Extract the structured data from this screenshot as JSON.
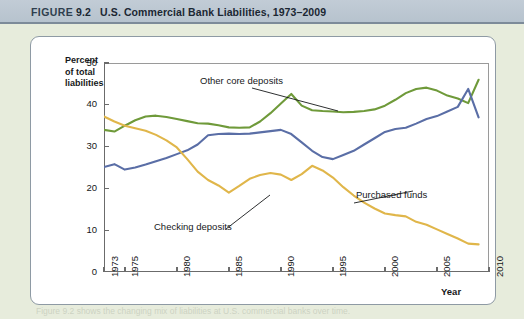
{
  "header": {
    "figure_label": "FIGURE",
    "figure_number": "9.2",
    "title": "U.S. Commercial Bank Liabilities, 1973–2009"
  },
  "axis_titles": {
    "y_line1": "Percent",
    "y_line2": "of total",
    "y_line3": "liabilities",
    "x": "Year"
  },
  "annotations": {
    "other_core_deposits": "Other core deposits",
    "purchased_funds": "Purchased funds",
    "checking_deposits": "Checking deposits"
  },
  "caption_ghost": "Figure 9.2 shows the changing mix of liabilities at U.S. commercial banks over time.",
  "colors": {
    "other_core_deposits": "#6f9a3a",
    "purchased_funds": "#5a6ea6",
    "checking_deposits": "#e0b64a",
    "axis": "#6b6b6b",
    "header_bg": "#bcc7d2",
    "page_bg": "#e7ecdc",
    "card_bg": "#ffffff"
  },
  "chart_data": {
    "type": "line",
    "title": "U.S. Commercial Bank Liabilities, 1973–2009",
    "xlabel": "Year",
    "ylabel": "Percent of total liabilities",
    "xlim": [
      1973,
      2010
    ],
    "ylim": [
      0,
      50
    ],
    "yticks": [
      0,
      10,
      20,
      30,
      40,
      50
    ],
    "xticks": [
      1973,
      1975,
      1980,
      1985,
      1990,
      1995,
      2000,
      2005,
      2010
    ],
    "xtick_labels": [
      "1973",
      "1975",
      "1980",
      "1985",
      "1990",
      "1995",
      "2000",
      "2005",
      "2010"
    ],
    "grid": false,
    "legend": "inline-annotations",
    "x": [
      1973,
      1974,
      1975,
      1976,
      1977,
      1978,
      1979,
      1980,
      1981,
      1982,
      1983,
      1984,
      1985,
      1986,
      1987,
      1988,
      1989,
      1990,
      1991,
      1992,
      1993,
      1994,
      1995,
      1996,
      1997,
      1998,
      1999,
      2000,
      2001,
      2002,
      2003,
      2004,
      2005,
      2006,
      2007,
      2008,
      2009
    ],
    "series": [
      {
        "name": "Other core deposits",
        "color": "#6f9a3a",
        "values": [
          34.0,
          33.6,
          35.0,
          36.3,
          37.2,
          37.4,
          37.1,
          36.6,
          36.1,
          35.6,
          35.5,
          35.1,
          34.6,
          34.5,
          34.6,
          36.0,
          38.0,
          40.3,
          42.6,
          39.8,
          38.7,
          38.5,
          38.4,
          38.2,
          38.3,
          38.5,
          38.9,
          39.8,
          41.2,
          42.8,
          43.8,
          44.1,
          43.4,
          42.2,
          41.5,
          40.4,
          46.0
        ]
      },
      {
        "name": "Purchased funds",
        "color": "#5a6ea6",
        "values": [
          25.1,
          25.8,
          24.5,
          25.0,
          25.7,
          26.5,
          27.3,
          28.2,
          29.1,
          30.5,
          32.7,
          33.0,
          33.1,
          33.0,
          33.1,
          33.4,
          33.7,
          34.0,
          33.0,
          31.0,
          29.0,
          27.5,
          27.0,
          28.0,
          29.0,
          30.5,
          32.0,
          33.5,
          34.2,
          34.5,
          35.5,
          36.6,
          37.3,
          38.4,
          39.5,
          43.8,
          37.0
        ]
      },
      {
        "name": "Checking deposits",
        "color": "#e0b64a",
        "values": [
          37.2,
          36.0,
          35.0,
          34.4,
          33.8,
          32.8,
          31.5,
          29.8,
          27.0,
          24.0,
          22.0,
          20.7,
          19.0,
          20.6,
          22.3,
          23.2,
          23.7,
          23.3,
          22.0,
          23.4,
          25.4,
          24.3,
          22.6,
          20.3,
          18.3,
          16.6,
          15.2,
          14.0,
          13.6,
          13.3,
          12.0,
          11.3,
          10.2,
          9.1,
          8.0,
          6.8,
          6.6
        ]
      }
    ]
  }
}
